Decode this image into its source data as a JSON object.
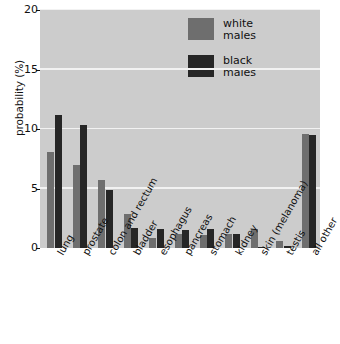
{
  "chart_data": {
    "type": "bar",
    "title": "",
    "xlabel": "",
    "ylabel": "probability (%)",
    "ylim": [
      0,
      20
    ],
    "yticks": [
      "0",
      "5",
      "10",
      "15",
      "20"
    ],
    "grid": true,
    "legend_position": "upper right inside plot",
    "categories": [
      "lung",
      "prostate",
      "colon and rectum",
      "bladder",
      "esophagus",
      "pancreas",
      "stomach",
      "kidney",
      "skin (melanoma)",
      "testis",
      "all other"
    ],
    "series": [
      {
        "name": "white males",
        "color": "#6e6e6e",
        "values": [
          8.1,
          7.0,
          5.7,
          2.9,
          0.8,
          1.2,
          1.1,
          1.2,
          1.6,
          0.6,
          9.6
        ]
      },
      {
        "name": "black males",
        "color": "#262626",
        "values": [
          11.2,
          10.3,
          4.9,
          1.7,
          1.6,
          1.5,
          1.6,
          1.2,
          0.1,
          0.15,
          9.5
        ]
      }
    ]
  },
  "legend": {
    "entries": [
      {
        "label_line1": "white",
        "label_line2": "males",
        "swatch": "#6e6e6e"
      },
      {
        "label_line1": "black",
        "label_line2": "males",
        "swatch": "#262626"
      }
    ]
  },
  "colors": {
    "plot_background": "#cccccc",
    "gridline": "#f2f2f2",
    "white_males_bar": "#6e6e6e",
    "black_males_bar": "#262626",
    "text": "#111111",
    "page_background": "#ffffff"
  }
}
